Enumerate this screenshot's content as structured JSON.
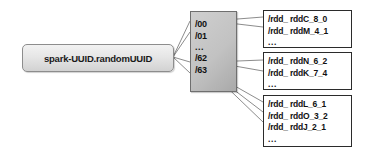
{
  "diagram": {
    "colors": {
      "root_box_fill": "#e6e6e6",
      "root_box_border": "#8d8d8d",
      "hash_box_fill": "#c2c2c2",
      "hash_box_border": "#6f6f6f",
      "file_box_fill": "#ffffff",
      "file_box_border": "#2b2b2b",
      "connector": "#6e6e6e",
      "text": "#111111",
      "background": "#ffffff"
    }
  },
  "root": {
    "label": "spark-UUID.randomUUID"
  },
  "hash_dirs": {
    "items": [
      {
        "label": "/00"
      },
      {
        "label": "/01"
      },
      {
        "label": "..."
      },
      {
        "label": "/62"
      },
      {
        "label": "/63"
      }
    ]
  },
  "file_groups": [
    {
      "id": "group-00",
      "files": [
        "/rdd_ rddC_8_0",
        "/rdd_ rddM_4_1",
        "..."
      ]
    },
    {
      "id": "group-62",
      "files": [
        "/rdd_ rddN_6_2",
        "/rdd_ rddK_7_4",
        "..."
      ]
    },
    {
      "id": "group-63",
      "files": [
        "/rdd_ rddL_6_1",
        "/rdd_ rddO_3_2",
        "/rdd_ rddJ_2_1",
        "..."
      ]
    }
  ]
}
